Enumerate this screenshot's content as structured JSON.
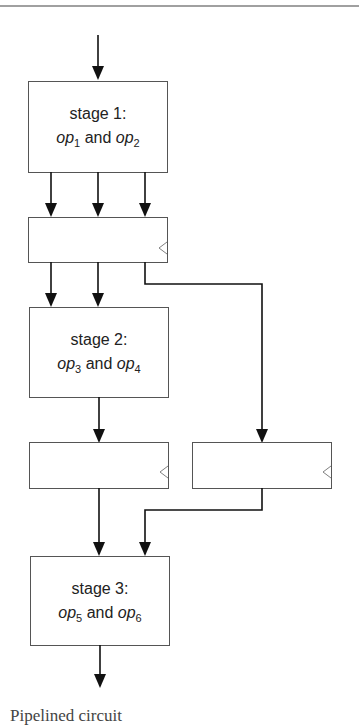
{
  "diagram": {
    "stages": [
      {
        "id": "stage-1",
        "title": "stage 1:",
        "op_a": "op",
        "op_a_sub": "1",
        "conj": "and",
        "op_b": "op",
        "op_b_sub": "2"
      },
      {
        "id": "stage-2",
        "title": "stage 2:",
        "op_a": "op",
        "op_a_sub": "3",
        "conj": "and",
        "op_b": "op",
        "op_b_sub": "4"
      },
      {
        "id": "stage-3",
        "title": "stage 3:",
        "op_a": "op",
        "op_a_sub": "5",
        "conj": "and",
        "op_b": "op",
        "op_b_sub": "6"
      }
    ],
    "registers": [
      {
        "id": "register-1",
        "clock_icon": "clock-triangle-icon"
      },
      {
        "id": "register-2a",
        "clock_icon": "clock-triangle-icon"
      },
      {
        "id": "register-2b",
        "clock_icon": "clock-triangle-icon"
      }
    ],
    "colors": {
      "box_stroke": "#555555",
      "wire": "#111111",
      "clock": "#808080",
      "top_rule": "#a0a0a0"
    }
  },
  "caption": {
    "text": "Pipelined circuit"
  }
}
